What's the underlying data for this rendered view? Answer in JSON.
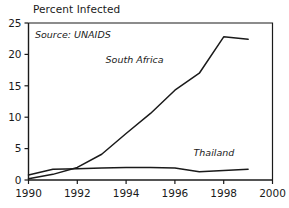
{
  "chart_data": {
    "type": "line",
    "title": "Percent Infected",
    "xlabel": "",
    "ylabel": "",
    "annotations": [
      "Source: UNAIDS"
    ],
    "source_note": "Source: UNAIDS",
    "grid": false,
    "legend": "inline-labels",
    "xlim": [
      1990,
      2000
    ],
    "ylim": [
      0,
      25
    ],
    "xticks": [
      1990,
      1992,
      1994,
      1996,
      1998,
      2000
    ],
    "xtick_labels": [
      "1990",
      "1992",
      "1994",
      "1996",
      "1998",
      "2000"
    ],
    "yticks": [
      0,
      5,
      10,
      15,
      20,
      25
    ],
    "ytick_labels": [
      "0",
      "5",
      "10",
      "15",
      "20",
      "25"
    ],
    "x": [
      1990,
      1991,
      1992,
      1993,
      1994,
      1995,
      1996,
      1997,
      1998,
      1999
    ],
    "series": [
      {
        "name": "South Africa",
        "label_x": 1994.35,
        "label_y": 18.6,
        "values": [
          0.2,
          0.9,
          2.0,
          4.1,
          7.4,
          10.6,
          14.3,
          17.0,
          22.8,
          22.4
        ]
      },
      {
        "name": "Thailand",
        "label_x": 1997.6,
        "label_y": 3.9,
        "values": [
          0.8,
          1.7,
          1.8,
          1.9,
          2.0,
          2.0,
          1.9,
          1.3,
          1.5,
          1.7
        ]
      }
    ],
    "colors": {
      "line": "#1a1a1a",
      "axis": "#1a1a1a",
      "background": "#ffffff",
      "text": "#1a1a1a"
    }
  }
}
